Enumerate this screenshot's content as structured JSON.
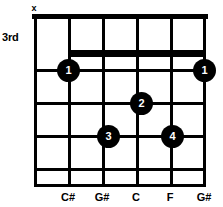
{
  "diagram": {
    "type": "guitar-chord-diagram",
    "position_label": "3rd",
    "string_count": 6,
    "fret_count": 5,
    "string_markers": [
      "x",
      "",
      "",
      "",
      "",
      ""
    ],
    "note_labels": [
      "",
      "C#",
      "G#",
      "C",
      "F",
      "G#"
    ],
    "fingerings": [
      {
        "finger": "1",
        "string": 2,
        "fret": 1,
        "x": 68,
        "y": 70
      },
      {
        "finger": "1",
        "string": 6,
        "fret": 1,
        "x": 204,
        "y": 70
      },
      {
        "finger": "2",
        "string": 4,
        "fret": 2,
        "x": 141,
        "y": 103
      },
      {
        "finger": "3",
        "string": 3,
        "fret": 3,
        "x": 108,
        "y": 136
      },
      {
        "finger": "4",
        "string": 5,
        "fret": 3,
        "x": 172,
        "y": 136
      }
    ],
    "barre": {
      "finger": "1",
      "from_string": 2,
      "to_string": 6,
      "fret": 1
    },
    "colors": {
      "ink": "#000000",
      "background": "#ffffff",
      "dot_text": "#ffffff"
    }
  }
}
